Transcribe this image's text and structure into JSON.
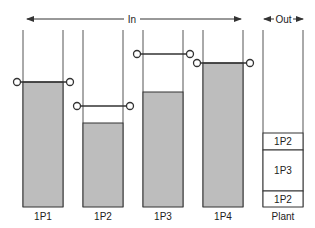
{
  "header": {
    "in_label": "In",
    "out_label": "Out"
  },
  "colors": {
    "fill": "#bdbdbd",
    "stroke": "#333333",
    "column_line": "#555555"
  },
  "columns": [
    {
      "label": "1P1",
      "x": 23,
      "fill_top": 82,
      "level_y": 82
    },
    {
      "label": "1P2",
      "x": 83,
      "fill_top": 123,
      "level_y": 106
    },
    {
      "label": "1P3",
      "x": 143,
      "fill_top": 92,
      "level_y": 54
    },
    {
      "label": "1P4",
      "x": 203,
      "fill_top": 63,
      "level_y": 63
    }
  ],
  "plant": {
    "label": "Plant",
    "segments": [
      {
        "label": "1P2",
        "top": 133,
        "bottom": 150
      },
      {
        "label": "1P3",
        "top": 150,
        "bottom": 191
      },
      {
        "label": "1P2",
        "top": 191,
        "bottom": 207
      }
    ]
  }
}
